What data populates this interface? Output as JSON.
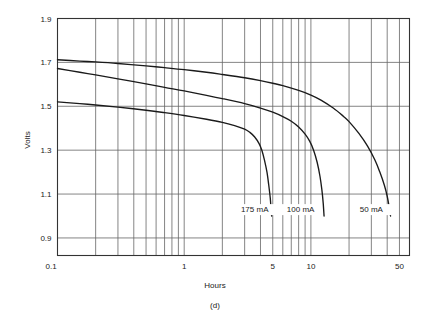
{
  "chart_data": {
    "type": "line",
    "title": "",
    "caption": "(d)",
    "xlabel": "Hours",
    "ylabel": "Volts",
    "xscale": "log",
    "yscale": "linear",
    "xlim": [
      0.1,
      60
    ],
    "ylim": [
      0.82,
      1.9
    ],
    "grid": true,
    "legend_position": "inline-at-curve-ends",
    "xticks_labeled": [
      {
        "value": 0.1,
        "label": "0.1"
      },
      {
        "value": 1,
        "label": "1"
      },
      {
        "value": 5,
        "label": "5"
      },
      {
        "value": 10,
        "label": "10"
      },
      {
        "value": 50,
        "label": "50"
      }
    ],
    "xticks_minor": [
      0.2,
      0.3,
      0.4,
      0.5,
      0.6,
      0.7,
      0.8,
      0.9,
      2,
      3,
      4,
      5,
      6,
      7,
      8,
      9,
      20,
      30,
      40,
      50
    ],
    "yticks_labeled": [
      {
        "value": 1.9,
        "label": "1.9"
      },
      {
        "value": 1.7,
        "label": "1.7"
      },
      {
        "value": 1.5,
        "label": "1.5"
      },
      {
        "value": 1.3,
        "label": "1.3"
      },
      {
        "value": 1.1,
        "label": "1.1"
      },
      {
        "value": 0.9,
        "label": "0.9"
      }
    ],
    "series": [
      {
        "name": "50 mA",
        "label": "50 mA",
        "label_x": 30,
        "label_y": 1.02,
        "points": [
          [
            0.1,
            1.712
          ],
          [
            0.15,
            1.706
          ],
          [
            0.2,
            1.702
          ],
          [
            0.3,
            1.695
          ],
          [
            0.5,
            1.684
          ],
          [
            0.7,
            1.676
          ],
          [
            1.0,
            1.667
          ],
          [
            1.5,
            1.655
          ],
          [
            2.0,
            1.645
          ],
          [
            3.0,
            1.63
          ],
          [
            4.0,
            1.617
          ],
          [
            5.0,
            1.605
          ],
          [
            6.0,
            1.594
          ],
          [
            8.0,
            1.572
          ],
          [
            10.0,
            1.551
          ],
          [
            12.0,
            1.528
          ],
          [
            15.0,
            1.492
          ],
          [
            18.0,
            1.455
          ],
          [
            20.0,
            1.43
          ],
          [
            24.0,
            1.375
          ],
          [
            28.0,
            1.318
          ],
          [
            32.0,
            1.255
          ],
          [
            35.0,
            1.2
          ],
          [
            38.0,
            1.14
          ],
          [
            40.0,
            1.09
          ],
          [
            41.5,
            1.04
          ],
          [
            42.5,
            1.0
          ]
        ]
      },
      {
        "name": "100 mA",
        "label": "100 mA",
        "label_x": 8.3,
        "label_y": 1.02,
        "points": [
          [
            0.1,
            1.672
          ],
          [
            0.15,
            1.655
          ],
          [
            0.2,
            1.643
          ],
          [
            0.3,
            1.625
          ],
          [
            0.5,
            1.602
          ],
          [
            0.7,
            1.586
          ],
          [
            1.0,
            1.57
          ],
          [
            1.5,
            1.55
          ],
          [
            2.0,
            1.535
          ],
          [
            3.0,
            1.512
          ],
          [
            4.0,
            1.492
          ],
          [
            5.0,
            1.473
          ],
          [
            6.0,
            1.453
          ],
          [
            7.0,
            1.432
          ],
          [
            8.0,
            1.406
          ],
          [
            9.0,
            1.373
          ],
          [
            9.8,
            1.34
          ],
          [
            10.5,
            1.3
          ],
          [
            11.2,
            1.245
          ],
          [
            11.8,
            1.18
          ],
          [
            12.2,
            1.12
          ],
          [
            12.5,
            1.06
          ],
          [
            12.7,
            1.0
          ]
        ]
      },
      {
        "name": "175 mA",
        "label": "175 mA",
        "label_x": 3.6,
        "label_y": 1.02,
        "points": [
          [
            0.1,
            1.52
          ],
          [
            0.15,
            1.512
          ],
          [
            0.2,
            1.506
          ],
          [
            0.3,
            1.496
          ],
          [
            0.5,
            1.482
          ],
          [
            0.7,
            1.471
          ],
          [
            1.0,
            1.458
          ],
          [
            1.5,
            1.441
          ],
          [
            2.0,
            1.427
          ],
          [
            2.5,
            1.412
          ],
          [
            3.0,
            1.396
          ],
          [
            3.3,
            1.381
          ],
          [
            3.6,
            1.36
          ],
          [
            3.9,
            1.33
          ],
          [
            4.1,
            1.3
          ],
          [
            4.3,
            1.255
          ],
          [
            4.5,
            1.2
          ],
          [
            4.65,
            1.14
          ],
          [
            4.78,
            1.08
          ],
          [
            4.85,
            1.03
          ],
          [
            4.9,
            1.0
          ]
        ]
      }
    ]
  },
  "figure": {
    "caption": "(d)",
    "axis_x_title": "Hours",
    "axis_y_title": "Volts",
    "colors": {
      "curve": "#1a1a1a",
      "grid": "#666666",
      "axis": "#333333",
      "text": "#1a1a1a",
      "background": "#ffffff"
    }
  }
}
